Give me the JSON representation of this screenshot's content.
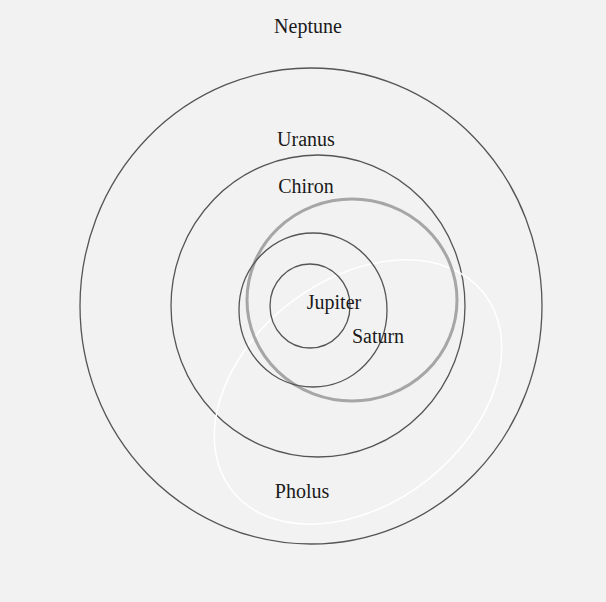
{
  "diagram": {
    "title": "",
    "labels": {
      "neptune": "Neptune",
      "uranus": "Uranus",
      "chiron": "Chiron",
      "jupiter": "Jupiter",
      "saturn": "Saturn",
      "pholus": "Pholus"
    },
    "orbits": [
      {
        "name": "Neptune",
        "style": "dark",
        "cx": 311,
        "cy": 306,
        "rx": 231,
        "ry": 238
      },
      {
        "name": "Uranus",
        "style": "dark",
        "cx": 318,
        "cy": 306,
        "rx": 147,
        "ry": 151
      },
      {
        "name": "Saturn",
        "style": "dark",
        "cx": 313,
        "cy": 310,
        "rx": 74,
        "ry": 77
      },
      {
        "name": "Jupiter",
        "style": "dark",
        "cx": 310,
        "cy": 306,
        "rx": 40,
        "ry": 42
      },
      {
        "name": "Chiron",
        "style": "gray-thick",
        "cx": 352,
        "cy": 300,
        "rx": 105,
        "ry": 101
      },
      {
        "name": "Pholus",
        "style": "white",
        "cx": 358,
        "cy": 392,
        "rx": 160,
        "ry": 112,
        "rotation": -38
      }
    ],
    "colors": {
      "background": "#f2f2f2",
      "orbit_dark": "#555555",
      "orbit_chiron": "#a6a6a6",
      "orbit_pholus": "#ffffff",
      "text": "#1a1a1a"
    }
  }
}
